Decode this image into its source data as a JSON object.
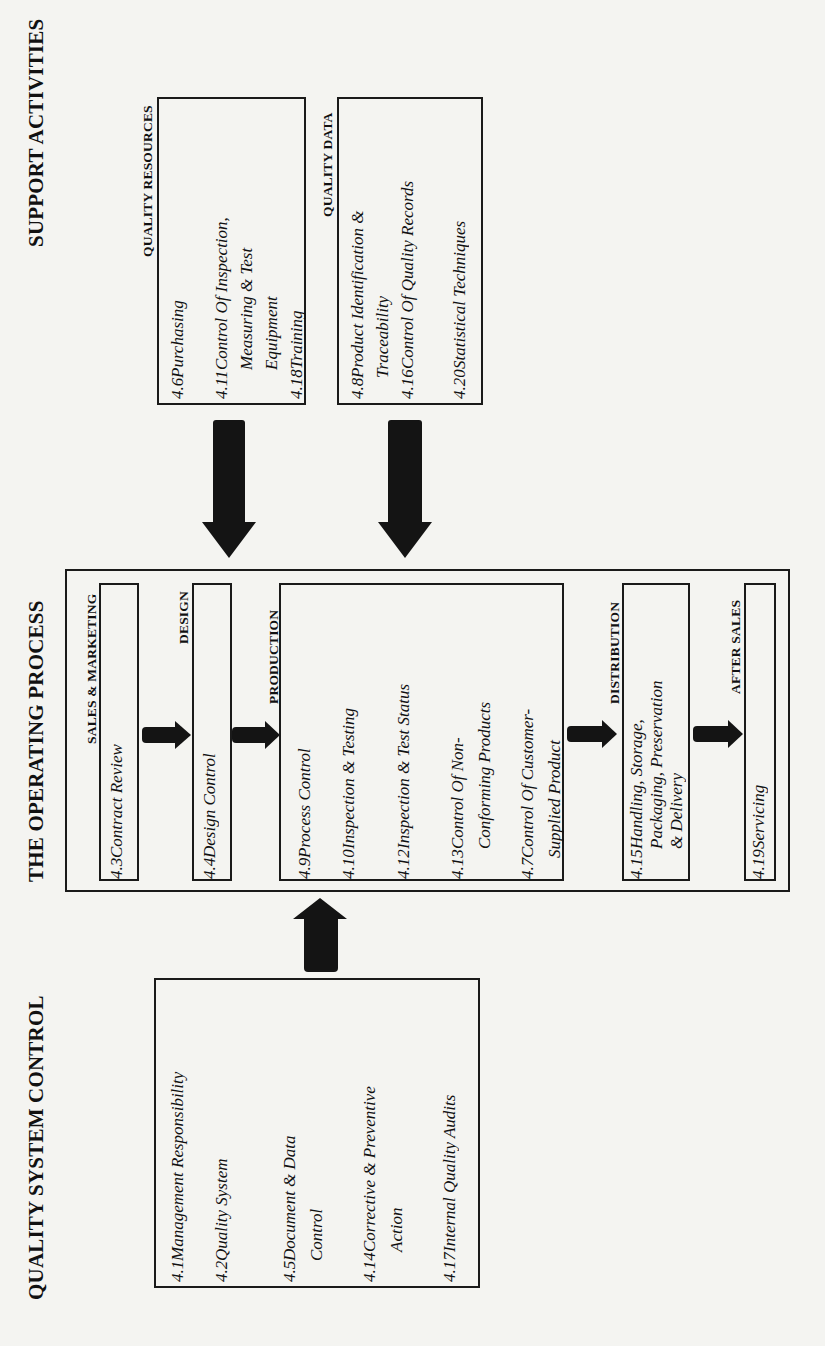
{
  "headings": {
    "support": "SUPPORT ACTIVITIES",
    "operating": "THE OPERATING PROCESS",
    "quality_control": "QUALITY SYSTEM CONTROL"
  },
  "support": {
    "resources": {
      "label": "QUALITY RESOURCES",
      "items": [
        {
          "num": "4.6",
          "text": "Purchasing"
        },
        {
          "num": "4.11",
          "text": "Control Of Inspection,\nMeasuring & Test\nEquipment"
        },
        {
          "num": "4.18",
          "text": "Training"
        }
      ]
    },
    "data": {
      "label": "QUALITY DATA",
      "items": [
        {
          "num": "4.8",
          "text": "Product Identification &\nTraceability"
        },
        {
          "num": "4.16",
          "text": "Control Of Quality Records"
        },
        {
          "num": "4.20",
          "text": "Statistical Techniques"
        }
      ]
    }
  },
  "process": {
    "sales": {
      "label": "SALES & MARKETING",
      "items": [
        {
          "num": "4.3",
          "text": "Contract Review"
        }
      ]
    },
    "design": {
      "label": "DESIGN",
      "items": [
        {
          "num": "4.4",
          "text": "Design Control"
        }
      ]
    },
    "production": {
      "label": "PRODUCTION",
      "items": [
        {
          "num": "4.9",
          "text": "Process Control"
        },
        {
          "num": "4.10",
          "text": "Inspection & Testing"
        },
        {
          "num": "4.12",
          "text": "Inspection & Test Status"
        },
        {
          "num": "4.13",
          "text": "Control Of Non-\nConforming Products"
        },
        {
          "num": "4.7",
          "text": "Control Of Customer-\nSupplied Product"
        }
      ]
    },
    "distribution": {
      "label": "DISTRIBUTION",
      "items": [
        {
          "num": "4.15",
          "text": "Handling, Storage,\nPackaging, Preservation\n& Delivery"
        }
      ]
    },
    "after_sales": {
      "label": "AFTER SALES",
      "items": [
        {
          "num": "4.19",
          "text": "Servicing"
        }
      ]
    }
  },
  "quality_control": {
    "items": [
      {
        "num": "4.1",
        "text": "Management Responsibility"
      },
      {
        "num": "4.2",
        "text": "Quality System"
      },
      {
        "num": "4.5",
        "text": "Document & Data\nControl"
      },
      {
        "num": "4.14",
        "text": "Corrective & Preventive\nAction"
      },
      {
        "num": "4.17",
        "text": "Internal Quality Audits"
      }
    ]
  },
  "colors": {
    "background": "#f4f4f1",
    "ink": "#141414"
  }
}
